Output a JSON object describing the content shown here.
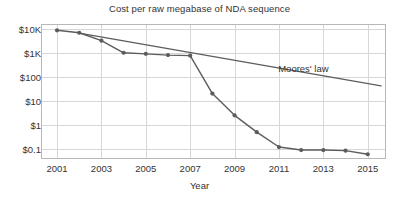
{
  "chart_data": {
    "type": "line",
    "title": "Cost per raw megabase of NDA sequence",
    "xlabel": "Year",
    "ylabel": "",
    "scale": "log-y",
    "grid": true,
    "legend_position": "inline-annotation",
    "xlim": [
      2000.3,
      2015.8
    ],
    "ylim": [
      0.04,
      15000
    ],
    "x_ticks": [
      2001,
      2003,
      2005,
      2007,
      2009,
      2011,
      2013,
      2015
    ],
    "x_tick_labels": [
      "2001",
      "2003",
      "2005",
      "2007",
      "2009",
      "2011",
      "2013",
      "2015"
    ],
    "y_ticks": [
      10000,
      1000,
      100,
      10,
      1,
      0.1
    ],
    "y_tick_labels": [
      "$10K",
      "$1K",
      "$100",
      "$10",
      "$1",
      "$0.1"
    ],
    "series": [
      {
        "name": "Cost per raw megabase",
        "color": "#5c5c5c",
        "marker": "circle",
        "x": [
          2001,
          2002,
          2003,
          2004,
          2005,
          2006,
          2007,
          2008,
          2009,
          2010,
          2011,
          2012,
          2013,
          2014,
          2015
        ],
        "values": [
          8600,
          6800,
          3200,
          1000,
          900,
          800,
          760,
          20,
          2.5,
          0.5,
          0.12,
          0.09,
          0.09,
          0.085,
          0.06
        ]
      },
      {
        "name": "Moores' law",
        "color": "#5c5c5c",
        "marker": "none",
        "x": [
          2002,
          2015.6
        ],
        "values": [
          6600,
          42
        ]
      }
    ],
    "annotations": [
      {
        "text": "Moores' law",
        "x": 2012.1,
        "y": 220
      }
    ],
    "colors": {
      "line": "#5c5c5c",
      "grid": "#d7d7d7",
      "axis": "#9a9a9a",
      "text": "#333333",
      "background": "#ffffff"
    }
  }
}
